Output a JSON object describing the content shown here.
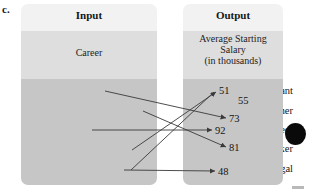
{
  "figure": {
    "part_label": "c."
  },
  "colors": {
    "panel_header": "#f2f2f2",
    "panel_mid": "#dedede",
    "panel_body": "#c6c6c6",
    "arrow": "#3a3a3a",
    "text": "#151515",
    "dot": "#0a0a0a"
  },
  "input_panel": {
    "title": "Input",
    "subtitle": "Career",
    "items": [
      {
        "label": "Accountant"
      },
      {
        "label": "Computer Programmer"
      },
      {
        "label": "Engineer"
      },
      {
        "label": "Social Worker"
      },
      {
        "label": "Paralegal"
      }
    ]
  },
  "output_panel": {
    "title": "Output",
    "subtitle_line1": "Average Starting",
    "subtitle_line2": "Salary",
    "subtitle_line3": "(in thousands)",
    "values": [
      {
        "value": "51"
      },
      {
        "value": "55"
      },
      {
        "value": "73"
      },
      {
        "value": "92"
      },
      {
        "value": "81"
      },
      {
        "value": "48"
      }
    ]
  },
  "mapping": [
    {
      "from": "Accountant",
      "to": "73"
    },
    {
      "from": "Computer Programmer",
      "to": "81"
    },
    {
      "from": "Engineer",
      "to": "92"
    },
    {
      "from": "Social Worker",
      "to": "51"
    },
    {
      "from": "Paralegal",
      "to": "48"
    }
  ],
  "annotation_dot": {
    "shape": "filled-circle"
  }
}
